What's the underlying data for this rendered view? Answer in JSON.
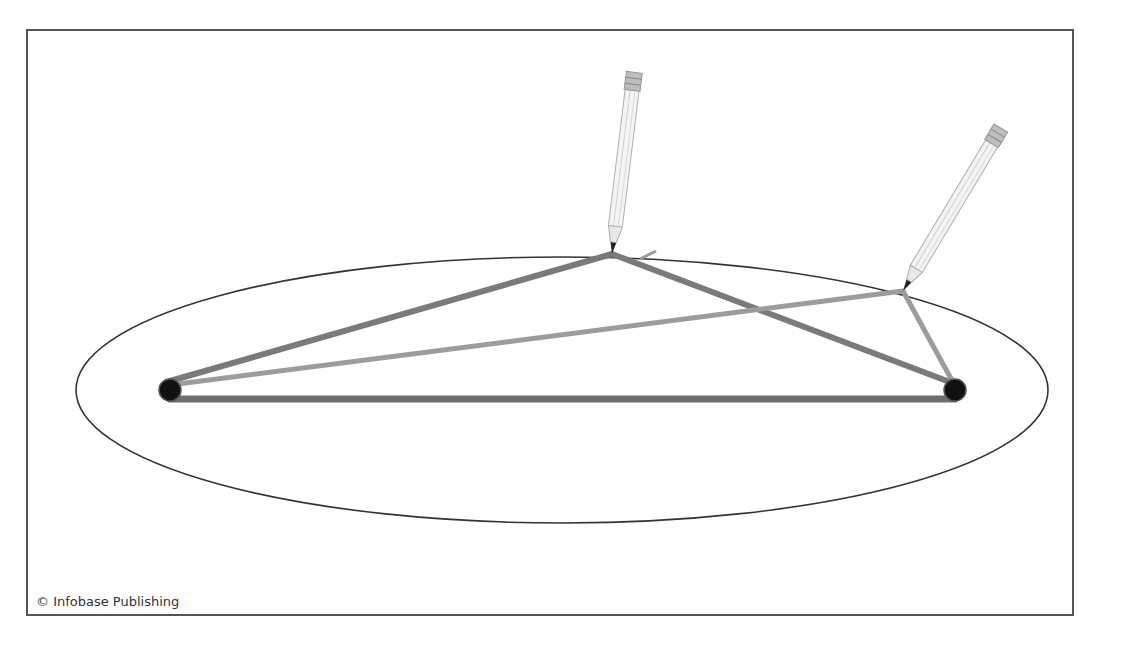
{
  "diagram": {
    "credit": "© Infobase Publishing",
    "colors": {
      "frame": "#555555",
      "ellipse": "#333333",
      "string_dark": "#767676",
      "string_light": "#9a9a9a",
      "pin": "#111111",
      "pencil_body": "#f2f2f2",
      "pencil_outline": "#aaaaaa"
    },
    "ellipse": {
      "cx": 562,
      "cy": 390,
      "rx": 486,
      "ry": 133
    },
    "foci": [
      {
        "name": "left-focus",
        "x": 170,
        "y": 390
      },
      {
        "name": "right-focus",
        "x": 955,
        "y": 390
      }
    ],
    "pencils": [
      {
        "name": "pencil-top",
        "tip_x": 612,
        "tip_y": 254,
        "top_x": 633,
        "top_y": 72
      },
      {
        "name": "pencil-right",
        "tip_x": 903,
        "tip_y": 291,
        "top_x": 1000,
        "top_y": 128
      }
    ]
  }
}
